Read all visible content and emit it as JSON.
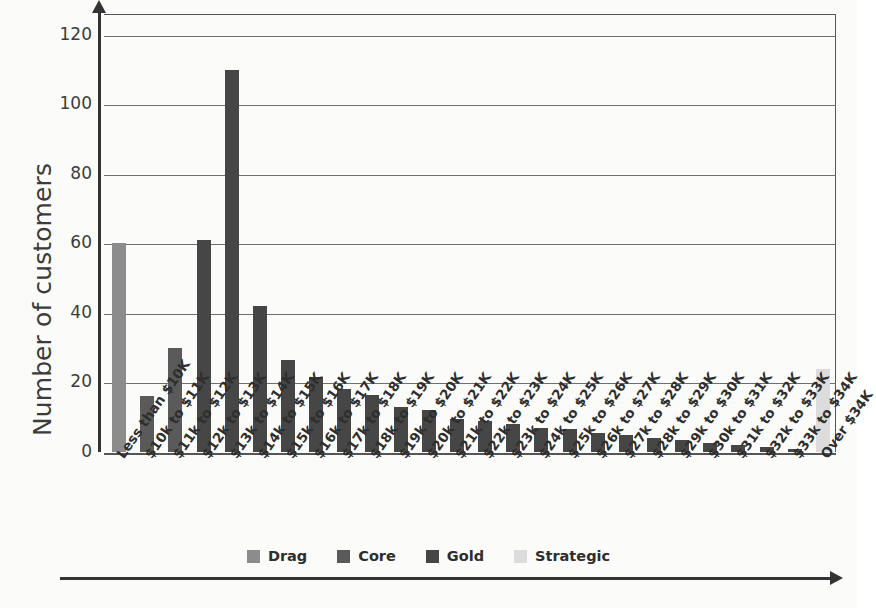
{
  "chart_data": {
    "type": "bar",
    "title": "",
    "xlabel": "",
    "ylabel": "Number of customers",
    "ylim": [
      0,
      126
    ],
    "yticks": [
      0,
      20,
      40,
      60,
      80,
      100,
      120
    ],
    "grid": true,
    "legend_position": "bottom",
    "categories": [
      "Less than $10K",
      "$10k to $11K",
      "$11k to $12K",
      "$12k to $13K",
      "$13k to $14K",
      "$14k to $15K",
      "$15k to $16K",
      "$16k to $17K",
      "$17k to $18K",
      "$18k to $19K",
      "$19k to $20K",
      "$20k to $21K",
      "$21k to $22K",
      "$22k to $23K",
      "$23k to $24K",
      "$24k to $25K",
      "$25k to $26K",
      "$26k to $27K",
      "$27k to $28K",
      "$28k to $29K",
      "$29k to $30K",
      "$30k to $31K",
      "$31k to $32K",
      "$32k to $33K",
      "$33k to $34K",
      "Over $34K"
    ],
    "values": [
      60,
      16,
      30,
      61,
      110,
      42,
      26.5,
      21.5,
      18,
      16.5,
      13,
      12,
      9.5,
      9,
      8,
      7,
      6.5,
      5.5,
      5,
      4,
      3.5,
      2.5,
      2,
      1.5,
      1,
      24
    ],
    "segments": [
      "Drag",
      "Core",
      "Core",
      "Gold",
      "Gold",
      "Gold",
      "Gold",
      "Gold",
      "Gold",
      "Gold",
      "Gold",
      "Gold",
      "Gold",
      "Gold",
      "Gold",
      "Gold",
      "Gold",
      "Gold",
      "Gold",
      "Gold",
      "Gold",
      "Gold",
      "Gold",
      "Gold",
      "Gold",
      "Strategic"
    ],
    "legend": [
      {
        "label": "Drag",
        "color": "#8c8c8c"
      },
      {
        "label": "Core",
        "color": "#5a5a5a"
      },
      {
        "label": "Gold",
        "color": "#464646"
      },
      {
        "label": "Strategic",
        "color": "#dcdcdc"
      }
    ],
    "colors": {
      "Drag": "#8c8c8c",
      "Core": "#5a5a5a",
      "Gold": "#464646",
      "Strategic": "#dcdcdc"
    }
  }
}
